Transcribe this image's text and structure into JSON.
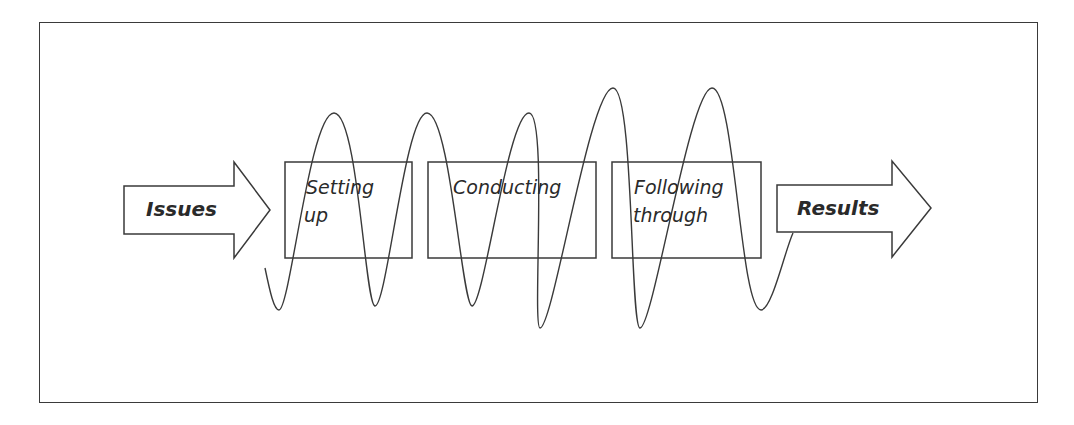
{
  "diagram": {
    "input_arrow": {
      "label": "Issues"
    },
    "stages": [
      {
        "label_line1": "Setting",
        "label_line2": "up"
      },
      {
        "label_line1": "Conducting",
        "label_line2": ""
      },
      {
        "label_line1": "Following",
        "label_line2": "through"
      }
    ],
    "output_arrow": {
      "label": "Results"
    },
    "connector": {
      "type": "oscillating-wave",
      "description": "sinusoidal line weaving through all stages from Issues to Results"
    },
    "colors": {
      "stroke": "#3a3a3a",
      "text": "#2a2a2a",
      "background": "#ffffff"
    }
  }
}
